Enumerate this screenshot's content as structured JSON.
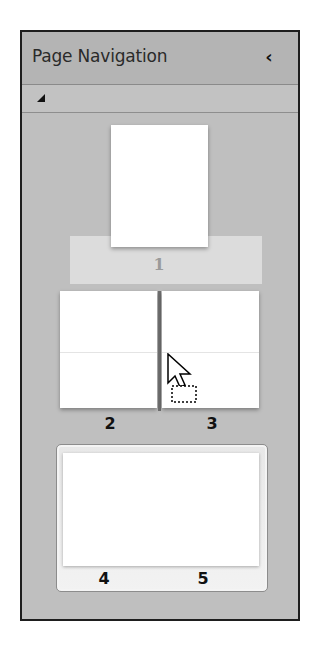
{
  "panel": {
    "title": "Page Navigation",
    "collapse_icon": "chevron-left-icon",
    "collapse_glyph": "‹",
    "toolbar": {
      "expand_icon": "triangle-expand-icon"
    }
  },
  "pages": [
    {
      "number": "1",
      "layout": "single",
      "selected": true
    },
    {
      "number": "2",
      "layout": "spread-left"
    },
    {
      "number": "3",
      "layout": "spread-right"
    },
    {
      "number": "4",
      "layout": "spread-left",
      "group": "4-5"
    },
    {
      "number": "5",
      "layout": "spread-right",
      "group": "4-5"
    }
  ],
  "drag": {
    "cursor_icon": "drag-move-cursor-icon",
    "insertion_marker_between": [
      "2",
      "3"
    ]
  },
  "colors": {
    "panel_bg": "#bfbfbf",
    "header_bg": "#b4b4b4",
    "selection_band": "#dcdcdc",
    "page_bg": "#ffffff",
    "border": "#1e1e1e"
  }
}
